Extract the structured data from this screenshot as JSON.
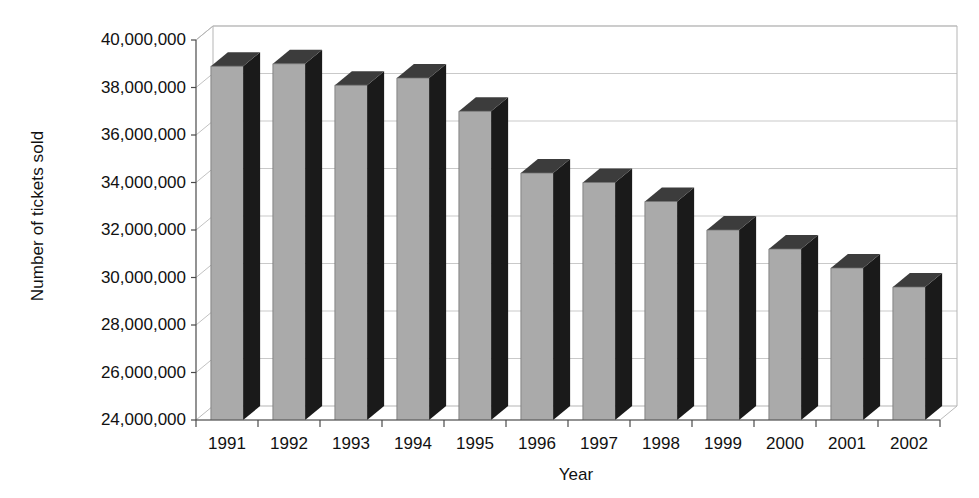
{
  "chart_data": {
    "type": "bar",
    "title": "",
    "xlabel": "Year",
    "ylabel": "Number of tickets sold",
    "categories": [
      "1991",
      "1992",
      "1993",
      "1994",
      "1995",
      "1996",
      "1997",
      "1998",
      "1999",
      "2000",
      "2001",
      "2002"
    ],
    "values": [
      38900000,
      39000000,
      38100000,
      38400000,
      37000000,
      34400000,
      34000000,
      33200000,
      32000000,
      31200000,
      30400000,
      29600000
    ],
    "ylim": [
      24000000,
      40000000
    ],
    "ytick_labels": [
      "40,000,000",
      "38,000,000",
      "36,000,000",
      "34,000,000",
      "32,000,000",
      "30,000,000",
      "28,000,000",
      "26,000,000",
      "24,000,000"
    ],
    "ytick_values": [
      40000000,
      38000000,
      36000000,
      34000000,
      32000000,
      30000000,
      28000000,
      26000000,
      24000000
    ],
    "ytick_step": 2000000,
    "grid": true,
    "legend": "none",
    "style": "3d-column",
    "colors": {
      "bar_front": "#aaaaaa",
      "bar_side": "#1a1a1a",
      "bar_top": "#3c3c3c",
      "gridline": "#c9c9c9",
      "axis": "#4a4a4a",
      "background": "#ffffff",
      "text": "#111111"
    }
  }
}
